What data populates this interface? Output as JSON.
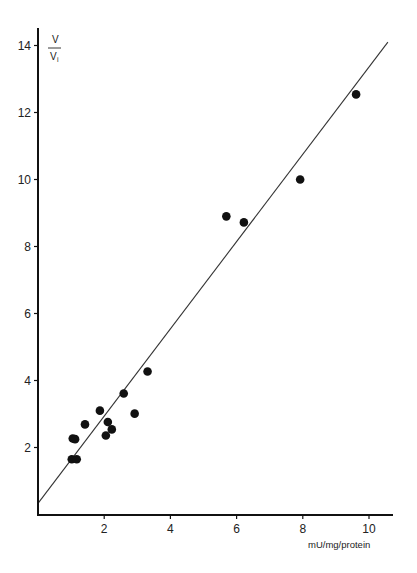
{
  "chart_data": {
    "type": "scatter",
    "title": "",
    "xlabel": "mU/mg/protein",
    "ylabel": "V/Vi",
    "ylabel_parts": {
      "numerator": "V",
      "denominator": "V",
      "subscript": "i"
    },
    "xlim": [
      0,
      10.7
    ],
    "ylim": [
      0,
      14.6
    ],
    "x_ticks": [
      2,
      4,
      6,
      8,
      10
    ],
    "y_ticks": [
      2,
      4,
      6,
      8,
      10,
      12,
      14
    ],
    "x_tick_labels": [
      "2",
      "4",
      "6",
      "8",
      "10"
    ],
    "y_tick_labels": [
      "2",
      "4",
      "6",
      "8",
      "10",
      "12",
      "14"
    ],
    "grid": false,
    "legend": null,
    "series": [
      {
        "name": "measurements",
        "marker": "filled-circle",
        "color": "#111111",
        "points": [
          {
            "x": 1.02,
            "y": 1.65
          },
          {
            "x": 1.17,
            "y": 1.65
          },
          {
            "x": 1.05,
            "y": 2.27
          },
          {
            "x": 1.12,
            "y": 2.25
          },
          {
            "x": 1.42,
            "y": 2.69
          },
          {
            "x": 1.87,
            "y": 3.1
          },
          {
            "x": 2.05,
            "y": 2.36
          },
          {
            "x": 2.11,
            "y": 2.76
          },
          {
            "x": 2.23,
            "y": 2.54
          },
          {
            "x": 2.59,
            "y": 3.61
          },
          {
            "x": 2.92,
            "y": 3.01
          },
          {
            "x": 3.31,
            "y": 4.27
          },
          {
            "x": 5.69,
            "y": 8.9
          },
          {
            "x": 6.22,
            "y": 8.72
          },
          {
            "x": 7.92,
            "y": 10.0
          },
          {
            "x": 9.61,
            "y": 12.54
          }
        ]
      }
    ],
    "fit_line": {
      "name": "linear regression",
      "color": "#333333",
      "x0": 0,
      "y0": 0.33,
      "x1": 10.57,
      "y1": 14.1
    }
  }
}
